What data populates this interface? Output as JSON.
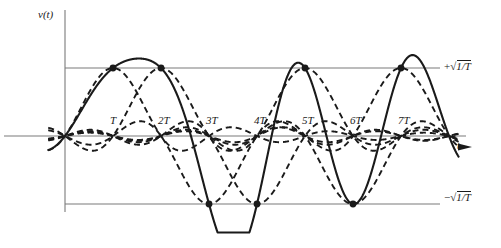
{
  "figure": {
    "kind": "signal-waveform-plot",
    "line_color": "#1a1a1a",
    "axis_color": "#7a7a7a",
    "background": "#ffffff"
  },
  "axes": {
    "y_axis_label": "v(t)",
    "x_axis_label": "t",
    "x_axis_arrow": "→",
    "origin_px": {
      "x": 65,
      "y": 136
    },
    "unit_px": 48,
    "amplitude_px": 68
  },
  "ticks": {
    "x": [
      {
        "label": "T",
        "value": 1
      },
      {
        "label": "2T",
        "value": 2
      },
      {
        "label": "3T",
        "value": 3
      },
      {
        "label": "4T",
        "value": 4
      },
      {
        "label": "5T",
        "value": 5
      },
      {
        "label": "6T",
        "value": 6
      },
      {
        "label": "7T",
        "value": 7
      }
    ]
  },
  "levels": [
    {
      "name": "upper-level",
      "sign": "+",
      "radicand": "1/T",
      "value_px_y": 68
    },
    {
      "name": "lower-level",
      "sign": "−",
      "radicand": "1/T",
      "value_px_y": 200
    }
  ],
  "chart_data": {
    "type": "line",
    "title": "",
    "xlabel": "t",
    "ylabel": "v(t)",
    "xlim": [
      -0.35,
      8.2
    ],
    "ylim": [
      -1.45,
      1.45
    ],
    "grid": false,
    "legend": null,
    "x_tick_labels": [
      "T",
      "2T",
      "3T",
      "4T",
      "5T",
      "6T",
      "7T"
    ],
    "x_tick_values": [
      1,
      2,
      3,
      4,
      5,
      6,
      7
    ],
    "y_tick_labels": [
      "+√(1/T)",
      "−√(1/T)"
    ],
    "y_tick_values": [
      1,
      -1
    ],
    "pulse_shape": "sinc",
    "symbol_period_T": 1,
    "symbols": [
      1,
      1,
      -1,
      -1,
      1,
      -1,
      1
    ],
    "symbol_delays": [
      1,
      2,
      3,
      4,
      5,
      6,
      7
    ],
    "series": [
      {
        "name": "pulse-1",
        "style": "dashed",
        "amplitude": 1,
        "delay": 1
      },
      {
        "name": "pulse-2",
        "style": "dashed",
        "amplitude": 1,
        "delay": 2
      },
      {
        "name": "pulse-3",
        "style": "dashed",
        "amplitude": -1,
        "delay": 3
      },
      {
        "name": "pulse-4",
        "style": "dashed",
        "amplitude": -1,
        "delay": 4
      },
      {
        "name": "pulse-5",
        "style": "dashed",
        "amplitude": 1,
        "delay": 5
      },
      {
        "name": "pulse-6",
        "style": "dashed",
        "amplitude": -1,
        "delay": 6
      },
      {
        "name": "pulse-7",
        "style": "dashed",
        "amplitude": 1,
        "delay": 7
      },
      {
        "name": "composite-sum",
        "style": "solid",
        "is_sum": true
      }
    ],
    "sample_points": [
      {
        "t": 1,
        "v": 1
      },
      {
        "t": 2,
        "v": 1
      },
      {
        "t": 3,
        "v": -1
      },
      {
        "t": 4,
        "v": -1
      },
      {
        "t": 5,
        "v": 1
      },
      {
        "t": 6,
        "v": -1
      },
      {
        "t": 7,
        "v": 1
      }
    ]
  }
}
